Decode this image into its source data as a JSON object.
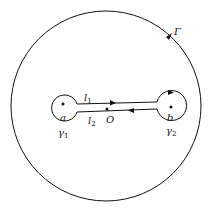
{
  "diagram": {
    "outer_contour": {
      "label": "Γ",
      "direction": "counterclockwise"
    },
    "point_a": {
      "label": "a"
    },
    "point_b": {
      "label": "b"
    },
    "point_o": {
      "label": "O"
    },
    "small_circle_a": {
      "label": "γ1",
      "base": "γ",
      "sub": "1"
    },
    "small_circle_b": {
      "label": "γ2",
      "base": "γ",
      "sub": "2"
    },
    "upper_segment": {
      "label": "l1",
      "base": "l",
      "sub": "1",
      "direction": "right"
    },
    "lower_segment": {
      "label": "l2",
      "base": "l",
      "sub": "2",
      "direction": "left"
    },
    "colors": {
      "stroke": "#111111",
      "background": "#ffffff"
    }
  }
}
